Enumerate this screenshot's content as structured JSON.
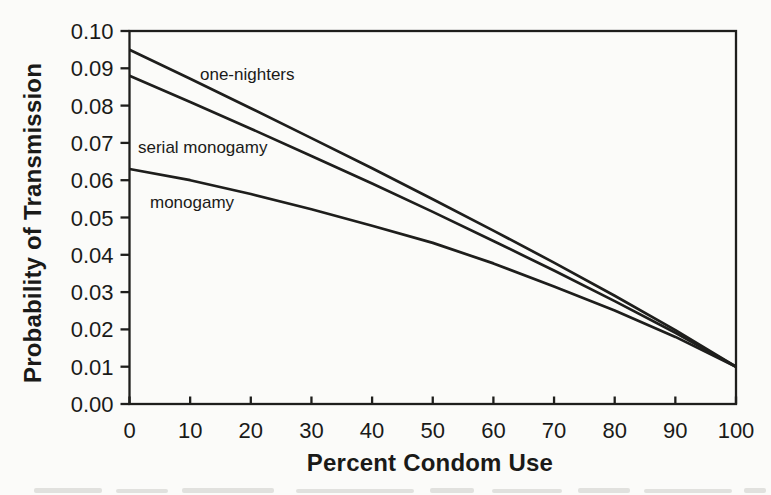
{
  "page": {
    "background": "#fbfbf9",
    "ink": "#1e1e1c",
    "text_color": "#1a1a18"
  },
  "chart_data": {
    "type": "line",
    "title": "",
    "xlabel": "Percent Condom Use",
    "ylabel": "Probability of Transmission",
    "xlim": [
      0,
      100
    ],
    "ylim": [
      0.0,
      0.1
    ],
    "grid": false,
    "legend": "inline labels on curves",
    "line_color": "#1e1e1c",
    "x": [
      0,
      10,
      20,
      30,
      40,
      50,
      60,
      70,
      80,
      90,
      100
    ],
    "x_tick_labels": [
      "0",
      "10",
      "20",
      "30",
      "40",
      "50",
      "60",
      "70",
      "80",
      "90",
      "100"
    ],
    "y_ticks": [
      0.0,
      0.01,
      0.02,
      0.03,
      0.04,
      0.05,
      0.06,
      0.07,
      0.08,
      0.09,
      0.1
    ],
    "y_tick_labels": [
      "0.00",
      "0.01",
      "0.02",
      "0.03",
      "0.04",
      "0.05",
      "0.06",
      "0.07",
      "0.08",
      "0.09",
      "0.10"
    ],
    "series": [
      {
        "name": "one-nighters",
        "values": [
          0.095,
          0.0872,
          0.0793,
          0.0713,
          0.0632,
          0.0549,
          0.0465,
          0.0379,
          0.029,
          0.0198,
          0.01
        ]
      },
      {
        "name": "serial monogamy",
        "values": [
          0.088,
          0.081,
          0.0738,
          0.0665,
          0.0591,
          0.0515,
          0.0437,
          0.0358,
          0.0276,
          0.0191,
          0.01
        ]
      },
      {
        "name": "monogamy",
        "values": [
          0.063,
          0.06,
          0.0563,
          0.0522,
          0.0478,
          0.0432,
          0.0377,
          0.0315,
          0.0251,
          0.018,
          0.01
        ]
      }
    ]
  }
}
